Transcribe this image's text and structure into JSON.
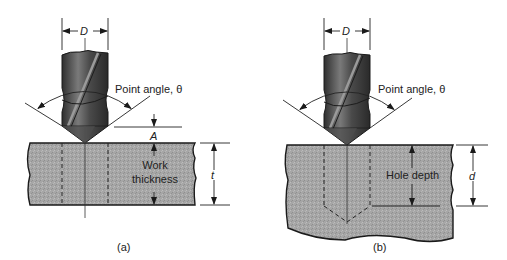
{
  "panels": [
    {
      "id": "a",
      "caption": "(a)",
      "diameter_label": "D",
      "point_angle_label": "Point angle, θ",
      "approach_label": "A",
      "depth_text_line1": "Work",
      "depth_text_line2": "thickness",
      "depth_symbol": "t",
      "hole_type": "through hole"
    },
    {
      "id": "b",
      "caption": "(b)",
      "diameter_label": "D",
      "point_angle_label": "Point angle, θ",
      "depth_text": "Hole depth",
      "depth_symbol": "d",
      "hole_type": "blind hole"
    }
  ],
  "colors": {
    "workpiece_fill": "#a9a9a9",
    "drill_dark": "#3a3a3a",
    "drill_mid": "#6e6e6e",
    "line": "#1a1a1a"
  }
}
